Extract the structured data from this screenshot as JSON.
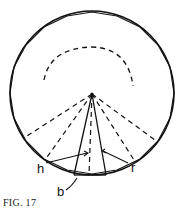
{
  "figure": {
    "caption": "FIG. 17",
    "labels": {
      "h": "h",
      "b": "b",
      "r": "r"
    },
    "colors": {
      "stroke": "#111111",
      "background": "#ffffff"
    }
  }
}
